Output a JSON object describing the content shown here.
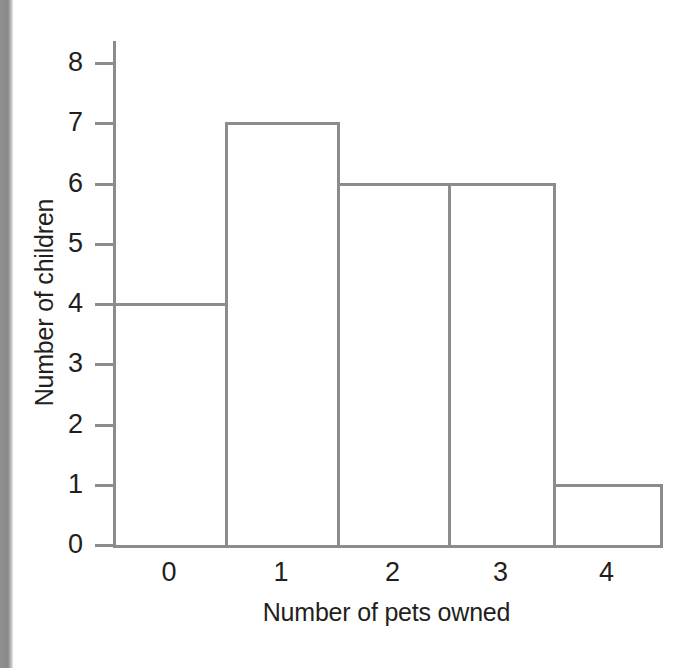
{
  "figure": {
    "background_color": "#ffffff",
    "line_color": "#8c8c8c",
    "text_color": "#231f20",
    "scan_edge_color": "#8a8a8a"
  },
  "chart_data": {
    "type": "bar",
    "title": "",
    "subtitle": "",
    "xlabel": "Number of pets owned",
    "ylabel": "Number of children",
    "categories": [
      "0",
      "1",
      "2",
      "3",
      "4"
    ],
    "values": [
      4,
      7,
      6,
      6,
      1
    ],
    "x_tick_labels": [
      "0",
      "1",
      "2",
      "3",
      "4"
    ],
    "y_tick_labels": [
      "0",
      "1",
      "2",
      "3",
      "4",
      "5",
      "6",
      "7",
      "8"
    ],
    "y_tick_values": [
      0,
      1,
      2,
      3,
      4,
      5,
      6,
      7,
      8
    ],
    "ylim": [
      0,
      8
    ],
    "grid": false,
    "legend": false,
    "legend_position": "none",
    "bar_style": "outlined-adjacent-histogram",
    "bar_fill": "#ffffff",
    "bar_outline": "#8c8c8c",
    "annotations": []
  }
}
